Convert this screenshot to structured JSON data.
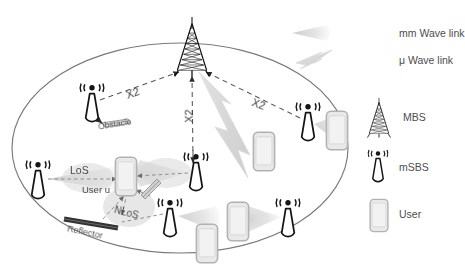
{
  "figure": {
    "type": "network-topology-diagram"
  },
  "legend": {
    "items": [
      {
        "icon": "mm-wave-beam-icon",
        "label": "mm Wave link"
      },
      {
        "icon": "mu-wave-bolt-icon",
        "label": "μ Wave link"
      },
      {
        "icon": "mbs-tower-icon",
        "label": "MBS"
      },
      {
        "icon": "msbs-antenna-icon",
        "label": "mSBS"
      },
      {
        "icon": "user-phone-icon",
        "label": "User"
      }
    ]
  },
  "annotations": {
    "x2_left": "X2",
    "x2_center": "X2",
    "x2_right": "X2",
    "obstacle": "Obstacle",
    "los": "LoS",
    "nlos": "NLoS",
    "user_u": "User u",
    "reflector": "Reflector"
  },
  "colors": {
    "stroke": "#1a1a1a",
    "beam": "#d9d9d9",
    "beam_dark": "#c9c9c9",
    "phone_fill": "#e8e8e8",
    "phone_stroke": "#b0b0b0",
    "cell_stroke": "#7a7a7a",
    "dashed_link": "#555555",
    "text": "#4d4d4d",
    "reflector_dark": "#3a3a3a",
    "bolt": "#d5d5d5",
    "background": "#ffffff"
  },
  "nodes": {
    "mbs": [
      {
        "name": "macro-base-station",
        "x": 192,
        "y": 58
      }
    ],
    "msbs": [
      {
        "name": "msbs-top-left",
        "x": 92,
        "y": 103
      },
      {
        "name": "msbs-left",
        "x": 38,
        "y": 180
      },
      {
        "name": "msbs-mid",
        "x": 196,
        "y": 172
      },
      {
        "name": "msbs-right",
        "x": 308,
        "y": 122
      },
      {
        "name": "msbs-bottom-left",
        "x": 170,
        "y": 218
      },
      {
        "name": "msbs-bottom-right",
        "x": 288,
        "y": 218
      }
    ],
    "users": [
      {
        "name": "user-u-center",
        "x": 126,
        "y": 178
      },
      {
        "name": "user-right-upper",
        "x": 336,
        "y": 132
      },
      {
        "name": "user-mid-right",
        "x": 263,
        "y": 152
      },
      {
        "name": "user-bottom-mid",
        "x": 237,
        "y": 222
      },
      {
        "name": "user-bottom-left",
        "x": 206,
        "y": 244
      }
    ]
  },
  "links": {
    "x2": [
      {
        "from": "msbs-top-left",
        "to": "mbs",
        "label": "X2"
      },
      {
        "from": "msbs-mid",
        "to": "mbs",
        "label": "X2"
      },
      {
        "from": "msbs-right",
        "to": "mbs",
        "label": "X2"
      }
    ],
    "mu_wave": [
      {
        "from": "mbs",
        "to": "user-mid-right"
      }
    ],
    "mm_wave": [
      {
        "from": "msbs-left",
        "to": "user-u-center",
        "label": "LoS"
      },
      {
        "from": "msbs-mid",
        "to": "user-u-center"
      },
      {
        "from": "msbs-bottom-left",
        "to": "reflector",
        "label": "NLoS"
      },
      {
        "from": "reflector",
        "to": "user-u-center",
        "label": "NLoS"
      },
      {
        "from": "msbs-right",
        "to": "user-right-upper"
      },
      {
        "from": "msbs-bottom-left",
        "to": "user-bottom-left"
      },
      {
        "from": "msbs-bottom-right",
        "to": "user-bottom-mid"
      }
    ]
  }
}
